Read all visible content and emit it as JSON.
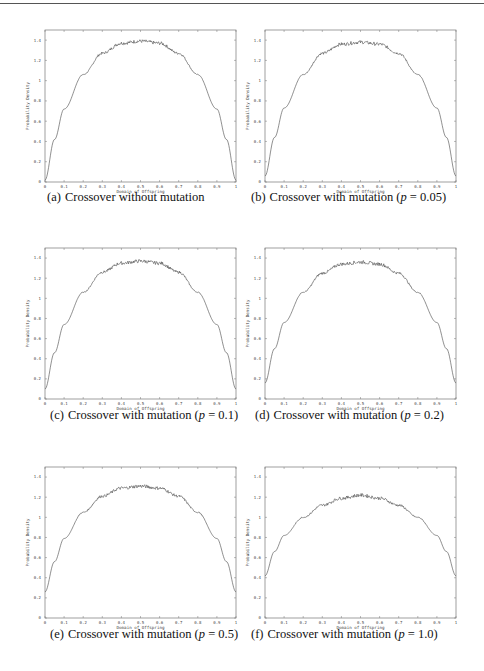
{
  "page": {
    "header_rule": true
  },
  "figure": {
    "panels": [
      {
        "id": "a",
        "tag": "(a)",
        "caption": "Crossover without mutation",
        "p": null
      },
      {
        "id": "b",
        "tag": "(b)",
        "caption": "Crossover with mutation",
        "p": "0.05"
      },
      {
        "id": "c",
        "tag": "(c)",
        "caption": "Crossover with mutation",
        "p": "0.1"
      },
      {
        "id": "d",
        "tag": "(d)",
        "caption": "Crossover with mutation",
        "p": "0.2"
      },
      {
        "id": "e",
        "tag": "(e)",
        "caption": "Crossover with mutation",
        "p": "0.5"
      },
      {
        "id": "f",
        "tag": "(f)",
        "caption": "Crossover with mutation",
        "p": "1.0"
      }
    ]
  },
  "chart_data": [
    {
      "type": "line",
      "panel": "a",
      "title": "(a) Crossover without mutation",
      "xlabel": "Domain of Offspring",
      "ylabel": "Probability Density",
      "xlim": [
        0,
        1
      ],
      "ylim": [
        0,
        1.5
      ],
      "xticks": [
        "0",
        "0.1",
        "0.2",
        "0.3",
        "0.4",
        "0.5",
        "0.6",
        "0.7",
        "0.8",
        "0.9",
        "1"
      ],
      "yticks": [
        "0",
        "0.2",
        "0.4",
        "0.6",
        "0.8",
        "1",
        "1.2",
        "1.4"
      ],
      "x": [
        0,
        0.05,
        0.1,
        0.2,
        0.3,
        0.4,
        0.5,
        0.6,
        0.7,
        0.8,
        0.9,
        0.95,
        1
      ],
      "y": [
        0.02,
        0.42,
        0.72,
        1.06,
        1.27,
        1.37,
        1.39,
        1.37,
        1.27,
        1.06,
        0.72,
        0.42,
        0.02
      ],
      "grid": false
    },
    {
      "type": "line",
      "panel": "b",
      "title": "(b) Crossover with mutation (p = 0.05)",
      "xlabel": "Domain of Offspring",
      "ylabel": "Probability Density",
      "xlim": [
        0,
        1
      ],
      "ylim": [
        0,
        1.5
      ],
      "xticks": [
        "0",
        "0.1",
        "0.2",
        "0.3",
        "0.4",
        "0.5",
        "0.6",
        "0.7",
        "0.8",
        "0.9",
        "1"
      ],
      "yticks": [
        "0",
        "0.2",
        "0.4",
        "0.6",
        "0.8",
        "1",
        "1.2",
        "1.4"
      ],
      "x": [
        0,
        0.05,
        0.1,
        0.2,
        0.3,
        0.4,
        0.5,
        0.6,
        0.7,
        0.8,
        0.9,
        0.95,
        1
      ],
      "y": [
        0.06,
        0.44,
        0.73,
        1.06,
        1.27,
        1.36,
        1.38,
        1.36,
        1.27,
        1.06,
        0.73,
        0.44,
        0.06
      ],
      "grid": false
    },
    {
      "type": "line",
      "panel": "c",
      "title": "(c) Crossover with mutation (p = 0.1)",
      "xlabel": "Domain of Offspring",
      "ylabel": "Probability Density",
      "xlim": [
        0,
        1
      ],
      "ylim": [
        0,
        1.5
      ],
      "xticks": [
        "0",
        "0.1",
        "0.2",
        "0.3",
        "0.4",
        "0.5",
        "0.6",
        "0.7",
        "0.8",
        "0.9",
        "1"
      ],
      "yticks": [
        "0",
        "0.2",
        "0.4",
        "0.6",
        "0.8",
        "1",
        "1.2",
        "1.4"
      ],
      "x": [
        0,
        0.05,
        0.1,
        0.2,
        0.3,
        0.4,
        0.5,
        0.6,
        0.7,
        0.8,
        0.9,
        0.95,
        1
      ],
      "y": [
        0.1,
        0.46,
        0.74,
        1.06,
        1.26,
        1.35,
        1.37,
        1.35,
        1.26,
        1.06,
        0.74,
        0.46,
        0.1
      ],
      "grid": false
    },
    {
      "type": "line",
      "panel": "d",
      "title": "(d) Crossover with mutation (p = 0.2)",
      "xlabel": "Domain of Offspring",
      "ylabel": "Probability Density",
      "xlim": [
        0,
        1
      ],
      "ylim": [
        0,
        1.5
      ],
      "xticks": [
        "0",
        "0.1",
        "0.2",
        "0.3",
        "0.4",
        "0.5",
        "0.6",
        "0.7",
        "0.8",
        "0.9",
        "1"
      ],
      "yticks": [
        "0",
        "0.2",
        "0.4",
        "0.6",
        "0.8",
        "1",
        "1.2",
        "1.4"
      ],
      "x": [
        0,
        0.05,
        0.1,
        0.2,
        0.3,
        0.4,
        0.5,
        0.6,
        0.7,
        0.8,
        0.9,
        0.95,
        1
      ],
      "y": [
        0.16,
        0.5,
        0.76,
        1.06,
        1.25,
        1.34,
        1.36,
        1.34,
        1.25,
        1.06,
        0.76,
        0.5,
        0.16
      ],
      "grid": false
    },
    {
      "type": "line",
      "panel": "e",
      "title": "(e) Crossover with mutation (p = 0.5)",
      "xlabel": "Domain of Offspring",
      "ylabel": "Probability Density",
      "xlim": [
        0,
        1
      ],
      "ylim": [
        0,
        1.5
      ],
      "xticks": [
        "0",
        "0.1",
        "0.2",
        "0.3",
        "0.4",
        "0.5",
        "0.6",
        "0.7",
        "0.8",
        "0.9",
        "1"
      ],
      "yticks": [
        "0",
        "0.2",
        "0.4",
        "0.6",
        "0.8",
        "1",
        "1.2",
        "1.4"
      ],
      "x": [
        0,
        0.05,
        0.1,
        0.2,
        0.3,
        0.4,
        0.5,
        0.6,
        0.7,
        0.8,
        0.9,
        0.95,
        1
      ],
      "y": [
        0.26,
        0.56,
        0.79,
        1.05,
        1.21,
        1.29,
        1.31,
        1.29,
        1.21,
        1.05,
        0.79,
        0.56,
        0.26
      ],
      "grid": false
    },
    {
      "type": "line",
      "panel": "f",
      "title": "(f) Crossover with mutation (p = 1.0)",
      "xlabel": "Domain of Offspring",
      "ylabel": "Probability Density",
      "xlim": [
        0,
        1
      ],
      "ylim": [
        0,
        1.5
      ],
      "xticks": [
        "0",
        "0.1",
        "0.2",
        "0.3",
        "0.4",
        "0.5",
        "0.6",
        "0.7",
        "0.8",
        "0.9",
        "1"
      ],
      "yticks": [
        "0",
        "0.2",
        "0.4",
        "0.6",
        "0.8",
        "1",
        "1.2",
        "1.4"
      ],
      "x": [
        0,
        0.05,
        0.1,
        0.2,
        0.3,
        0.4,
        0.5,
        0.6,
        0.7,
        0.8,
        0.9,
        0.95,
        1
      ],
      "y": [
        0.42,
        0.66,
        0.82,
        1.0,
        1.12,
        1.19,
        1.22,
        1.19,
        1.12,
        1.0,
        0.82,
        0.66,
        0.42
      ],
      "grid": false
    }
  ]
}
